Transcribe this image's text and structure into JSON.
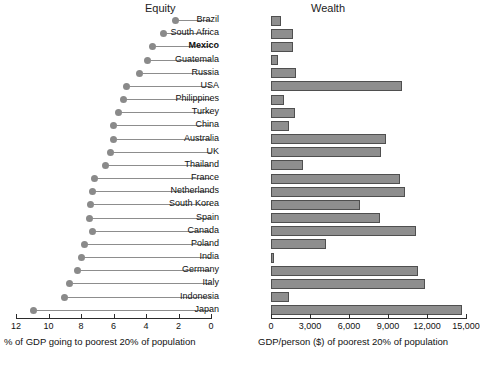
{
  "panels": {
    "left_title": "Equity",
    "right_title": "Wealth",
    "left_caption": "% of GDP going to poorest 20% of population",
    "right_caption": "GDP/person ($) of poorest 20% of population"
  },
  "axes": {
    "left_ticks": [
      "12",
      "10",
      "8",
      "6",
      "4",
      "2",
      "0"
    ],
    "left_tick_values": [
      12,
      10,
      8,
      6,
      4,
      2,
      0
    ],
    "right_ticks": [
      "0",
      "3,000",
      "6,000",
      "9,000",
      "12,000",
      "15,000"
    ],
    "right_tick_values": [
      0,
      3000,
      6000,
      9000,
      12000,
      15000
    ]
  },
  "highlight_country": "Mexico",
  "colors": {
    "bar_fill": "#8e8e8e",
    "bar_stroke": "#4f4f4f",
    "dot": "#8a8a8a",
    "line": "#8d8d8d",
    "axis": "#2b2b2b",
    "text": "#111111"
  },
  "chart_data": {
    "type": "bar",
    "xlabel": "% of GDP going to poorest 20% of population / GDP/person ($) of poorest 20% of population",
    "ylabel": "",
    "grid": false,
    "legend": "none",
    "categories": [
      "Brazil",
      "South Africa",
      "Mexico",
      "Guatemala",
      "Russia",
      "USA",
      "Philippines",
      "Turkey",
      "China",
      "Australia",
      "UK",
      "Thailand",
      "France",
      "Netherlands",
      "South Korea",
      "Spain",
      "Canada",
      "Poland",
      "India",
      "Germany",
      "Italy",
      "Indonesia",
      "Japan"
    ],
    "series": [
      {
        "name": "Equity",
        "unit": "% of GDP going to poorest 20% of population",
        "plot": "dot",
        "xlim": [
          12,
          0
        ],
        "axis_reversed": true,
        "values": [
          2.2,
          2.9,
          3.6,
          3.9,
          4.4,
          5.2,
          5.4,
          5.7,
          6.0,
          6.0,
          6.2,
          6.5,
          7.2,
          7.3,
          7.4,
          7.5,
          7.3,
          7.8,
          8.0,
          8.2,
          8.7,
          9.0,
          10.9
        ]
      },
      {
        "name": "Wealth",
        "unit": "GDP/person ($) of poorest 20% of population",
        "plot": "bar",
        "xlim": [
          0,
          15000
        ],
        "values": [
          770,
          1700,
          1700,
          540,
          1920,
          10080,
          1000,
          1850,
          1380,
          8850,
          8460,
          2460,
          9920,
          10300,
          6850,
          8380,
          11150,
          4230,
          230,
          11300,
          11850,
          1380,
          14700
        ]
      }
    ]
  }
}
